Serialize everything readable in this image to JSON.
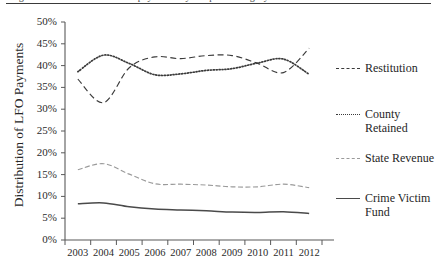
{
  "figure": {
    "caption_sliver": "Figure 3. Distribution of LFO payments by recipient category",
    "y_axis_title": "Distribution of LFO Payments"
  },
  "legend": {
    "position": "right",
    "items": [
      {
        "name": "Restitution",
        "label": "Restitution",
        "style": "dashed",
        "color": "#3a3a3a"
      },
      {
        "name": "County Retained",
        "label": "County\nRetained",
        "style": "dotted",
        "color": "#3a3a3a"
      },
      {
        "name": "State Revenue",
        "label": "State Revenue",
        "style": "dashdot",
        "color": "#9a9a9a"
      },
      {
        "name": "Crime Victim Fund",
        "label": "Crime Victim\nFund",
        "style": "solid",
        "color": "#4a4a4a"
      }
    ]
  },
  "chart_data": {
    "type": "line",
    "title": "",
    "xlabel": "",
    "ylabel": "Distribution of LFO Payments",
    "x": [
      2003,
      2004,
      2005,
      2006,
      2007,
      2008,
      2009,
      2010,
      2011,
      2012
    ],
    "categories": [
      "2003",
      "2004",
      "2005",
      "2006",
      "2007",
      "2008",
      "2009",
      "2010",
      "2011",
      "2012"
    ],
    "xtick_labels": [
      "2003",
      "2004",
      "2005",
      "2006",
      "2007",
      "2008",
      "2009",
      "2010",
      "2011",
      "2012"
    ],
    "ytick_labels": [
      "0%",
      "5%",
      "10%",
      "15%",
      "20%",
      "25%",
      "30%",
      "35%",
      "40%",
      "45%",
      "50%"
    ],
    "ytick_values": [
      0,
      5,
      10,
      15,
      20,
      25,
      30,
      35,
      40,
      45,
      50
    ],
    "ylim": [
      0,
      50
    ],
    "xlim": [
      2002.6,
      2012.4
    ],
    "grid": false,
    "series": [
      {
        "name": "Restitution",
        "style": "dashed",
        "color": "#3a3a3a",
        "values": [
          36.9,
          31.5,
          39.5,
          42.0,
          41.6,
          42.3,
          42.3,
          40.5,
          38.4,
          44.0
        ]
      },
      {
        "name": "County Retained",
        "style": "dotted",
        "color": "#3a3a3a",
        "values": [
          38.6,
          42.4,
          40.5,
          37.9,
          38.1,
          38.9,
          39.3,
          40.6,
          41.5,
          38.0
        ]
      },
      {
        "name": "State Revenue",
        "style": "dashdot",
        "color": "#9a9a9a",
        "values": [
          16.1,
          17.5,
          15.1,
          12.9,
          12.8,
          12.6,
          12.2,
          12.2,
          12.8,
          12.0
        ]
      },
      {
        "name": "Crime Victim Fund",
        "style": "solid",
        "color": "#4a4a4a",
        "values": [
          8.3,
          8.5,
          7.6,
          7.1,
          6.9,
          6.7,
          6.4,
          6.3,
          6.5,
          6.1
        ]
      }
    ]
  }
}
